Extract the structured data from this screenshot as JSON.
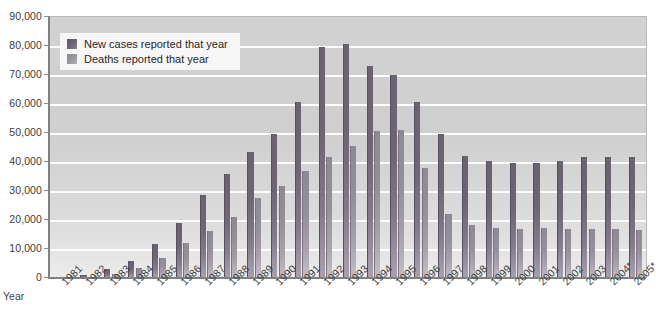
{
  "chart_data": {
    "type": "bar",
    "title": "",
    "xlabel": "Year",
    "ylabel": "",
    "ylim": [
      0,
      90000
    ],
    "ytick_step": 10000,
    "grid": true,
    "legend_position": "top-left",
    "ytick_labels": [
      "90,000",
      "80,000",
      "70,000",
      "60,000",
      "50,000",
      "40,000",
      "30,000",
      "20,000",
      "10,000",
      "0"
    ],
    "ytick_values": [
      90000,
      80000,
      70000,
      60000,
      50000,
      40000,
      30000,
      20000,
      10000,
      0
    ],
    "categories": [
      "1981",
      "1982",
      "1983",
      "1984",
      "1985",
      "1986",
      "1987",
      "1988",
      "1989",
      "1990",
      "1991",
      "1992",
      "1993",
      "1994",
      "1995",
      "1996",
      "1997",
      "1998",
      "1999",
      "2000",
      "2001",
      "2002",
      "2003",
      "2004*",
      "2005*"
    ],
    "series": [
      {
        "name": "New cases reported that year",
        "color": "#6b6270",
        "values": [
          300,
          1200,
          3000,
          6000,
          11800,
          19000,
          28700,
          35800,
          43400,
          49500,
          60600,
          79500,
          80800,
          73100,
          70000,
          60800,
          49500,
          42000,
          40200,
          39800,
          39500,
          40200,
          41700,
          41600,
          41800
        ]
      },
      {
        "name": "Deaths reported that year",
        "color": "#8f8895",
        "values": [
          130,
          450,
          1400,
          3300,
          6800,
          12200,
          16100,
          21200,
          27700,
          31800,
          36800,
          41600,
          45400,
          50800,
          51200,
          38000,
          22000,
          18200,
          17300,
          16800,
          17400,
          17000,
          16800,
          17000,
          16500
        ]
      }
    ]
  },
  "legend": {
    "items": [
      {
        "label": "New cases reported that year",
        "swatch": "cases"
      },
      {
        "label": "Deaths reported that year",
        "swatch": "deaths"
      }
    ]
  },
  "axis": {
    "x_title": "Year"
  }
}
